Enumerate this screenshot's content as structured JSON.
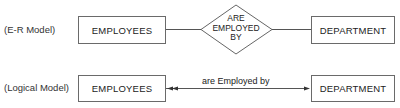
{
  "er_model": {
    "row_label": "(E-R Model)",
    "entity_left": "EMPLOYEES",
    "relationship": {
      "line1": "ARE",
      "line2": "EMPLOYED",
      "line3": "BY"
    },
    "entity_right": "DEPARTMENT"
  },
  "logical_model": {
    "row_label": "(Logical Model)",
    "entity_left": "EMPLOYEES",
    "relationship_label": "are Employed by",
    "entity_right": "DEPARTMENT"
  },
  "colors": {
    "line": "#555555",
    "box_border": "#6a6a6a",
    "text": "#222222"
  }
}
